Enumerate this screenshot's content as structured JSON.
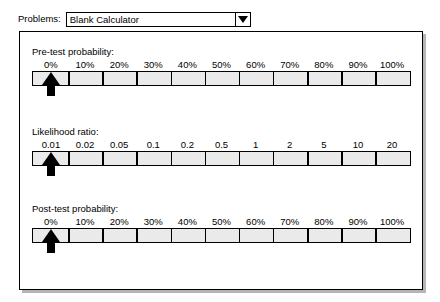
{
  "toolbar": {
    "problems_label": "Problems:",
    "problems_selected": "Blank Calculator",
    "dropdown_icon": "chevron-down-icon"
  },
  "panel": {
    "sliders": [
      {
        "id": "pretest",
        "title": "Pre-test probability:",
        "marker_icon": "up-arrow-marker",
        "marker_value": "0%",
        "ticks": [
          {
            "label": "0%",
            "pos": 0
          },
          {
            "label": "10%",
            "pos": 10
          },
          {
            "label": "20%",
            "pos": 20
          },
          {
            "label": "30%",
            "pos": 30
          },
          {
            "label": "40%",
            "pos": 40
          },
          {
            "label": "50%",
            "pos": 50
          },
          {
            "label": "60%",
            "pos": 60
          },
          {
            "label": "70%",
            "pos": 70
          },
          {
            "label": "80%",
            "pos": 80
          },
          {
            "label": "90%",
            "pos": 90
          },
          {
            "label": "100%",
            "pos": 100
          }
        ]
      },
      {
        "id": "lr",
        "title": "Likelihood ratio:",
        "marker_icon": "up-arrow-marker",
        "marker_value": "0.01",
        "ticks": [
          {
            "label": "0.01",
            "pos": 0
          },
          {
            "label": "0.02",
            "pos": 10
          },
          {
            "label": "0.05",
            "pos": 20
          },
          {
            "label": "0.1",
            "pos": 30
          },
          {
            "label": "0.2",
            "pos": 40
          },
          {
            "label": "0.5",
            "pos": 50
          },
          {
            "label": "1",
            "pos": 60
          },
          {
            "label": "2",
            "pos": 70
          },
          {
            "label": "5",
            "pos": 80
          },
          {
            "label": "10",
            "pos": 90
          },
          {
            "label": "20",
            "pos": 100
          }
        ]
      },
      {
        "id": "posttest",
        "title": "Post-test probability:",
        "marker_icon": "up-arrow-marker",
        "marker_value": "0%",
        "ticks": [
          {
            "label": "0%",
            "pos": 0
          },
          {
            "label": "10%",
            "pos": 10
          },
          {
            "label": "20%",
            "pos": 20
          },
          {
            "label": "30%",
            "pos": 30
          },
          {
            "label": "40%",
            "pos": 40
          },
          {
            "label": "50%",
            "pos": 50
          },
          {
            "label": "60%",
            "pos": 60
          },
          {
            "label": "70%",
            "pos": 70
          },
          {
            "label": "80%",
            "pos": 80
          },
          {
            "label": "90%",
            "pos": 90
          },
          {
            "label": "100%",
            "pos": 100
          }
        ]
      }
    ]
  },
  "colors": {
    "bar_fill": "#eaeaea",
    "bar_border": "#000000",
    "marker": "#000000",
    "panel_bg": "#ffffff"
  }
}
